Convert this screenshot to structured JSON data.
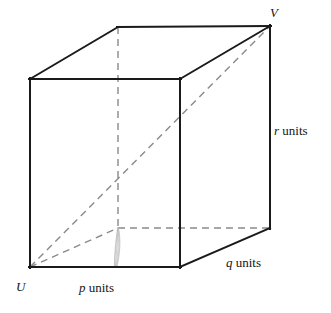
{
  "figure": {
    "type": "rectangular-prism-oblique-projection",
    "background_color": "#ffffff",
    "solid_edge_color": "#1a1a1a",
    "hidden_edge_color": "#8a8a8a",
    "artifact_color": "#b4b4b4"
  },
  "labels": {
    "vertex_u": "U",
    "vertex_v": "V",
    "p_var": "p",
    "p_units": " units",
    "q_var": "q",
    "q_units": " units",
    "r_var": "r",
    "r_units": " units"
  },
  "geometry": {
    "front_face": {
      "top_left": [
        30,
        79
      ],
      "top_right": [
        180,
        79
      ],
      "bottom_right": [
        180,
        267
      ],
      "bottom_left": [
        30,
        267
      ]
    },
    "back_face": {
      "top_left": [
        118,
        27
      ],
      "top_right": [
        270,
        26
      ],
      "bottom_right": [
        270,
        228
      ],
      "bottom_left": [
        118,
        228
      ]
    },
    "solid_edges": [
      [
        [
          30,
          79
        ],
        [
          180,
          79
        ]
      ],
      [
        [
          180,
          79
        ],
        [
          180,
          267
        ]
      ],
      [
        [
          180,
          267
        ],
        [
          30,
          267
        ]
      ],
      [
        [
          30,
          267
        ],
        [
          30,
          79
        ]
      ],
      [
        [
          30,
          79
        ],
        [
          118,
          27
        ]
      ],
      [
        [
          180,
          79
        ],
        [
          270,
          26
        ]
      ],
      [
        [
          118,
          27
        ],
        [
          270,
          26
        ]
      ],
      [
        [
          270,
          26
        ],
        [
          270,
          228
        ]
      ],
      [
        [
          180,
          267
        ],
        [
          270,
          228
        ]
      ]
    ],
    "hidden_edges": [
      [
        [
          118,
          27
        ],
        [
          118,
          228
        ]
      ],
      [
        [
          118,
          228
        ],
        [
          270,
          228
        ]
      ],
      [
        [
          30,
          267
        ],
        [
          118,
          228
        ]
      ]
    ],
    "space_diagonal": [
      [
        30,
        267
      ],
      [
        270,
        26
      ]
    ],
    "dimension_edges": {
      "p": [
        [
          30,
          267
        ],
        [
          180,
          267
        ]
      ],
      "q": [
        [
          180,
          267
        ],
        [
          270,
          228
        ]
      ],
      "r": [
        [
          270,
          26
        ],
        [
          270,
          228
        ]
      ]
    }
  }
}
